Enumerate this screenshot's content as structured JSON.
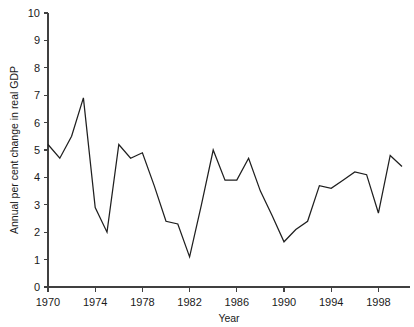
{
  "chart_data": {
    "type": "line",
    "title": "",
    "xlabel": "Year",
    "ylabel": "Annual per cent change in real GDP",
    "xlim": [
      1970,
      2000
    ],
    "ylim": [
      0,
      10
    ],
    "grid": false,
    "legend": null,
    "x_tick_labels": [
      "1970",
      "1974",
      "1978",
      "1982",
      "1986",
      "1990",
      "1994",
      "1998"
    ],
    "x_tick_values": [
      1970,
      1974,
      1978,
      1982,
      1986,
      1990,
      1994,
      1998
    ],
    "y_tick_labels": [
      "0",
      "1",
      "2",
      "3",
      "4",
      "5",
      "6",
      "7",
      "8",
      "9",
      "10"
    ],
    "y_tick_values": [
      0,
      1,
      2,
      3,
      4,
      5,
      6,
      7,
      8,
      9,
      10
    ],
    "line_color": "#1f1f1f",
    "x": [
      1970,
      1971,
      1972,
      1973,
      1974,
      1975,
      1976,
      1977,
      1978,
      1979,
      1980,
      1981,
      1982,
      1983,
      1984,
      1985,
      1986,
      1987,
      1988,
      1989,
      1990,
      1991,
      1992,
      1993,
      1994,
      1995,
      1996,
      1997,
      1998,
      1999,
      2000
    ],
    "values": [
      5.2,
      4.7,
      5.5,
      6.9,
      2.9,
      2.0,
      5.2,
      4.7,
      4.9,
      3.7,
      2.4,
      2.3,
      1.1,
      3.0,
      5.0,
      3.9,
      3.9,
      4.7,
      3.5,
      2.6,
      1.65,
      2.1,
      2.4,
      3.7,
      3.6,
      3.9,
      4.2,
      4.1,
      2.7,
      4.8,
      4.4
    ],
    "series": [
      {
        "name": "Annual per cent change in real GDP",
        "values": [
          5.2,
          4.7,
          5.5,
          6.9,
          2.9,
          2.0,
          5.2,
          4.7,
          4.9,
          3.7,
          2.4,
          2.3,
          1.1,
          3.0,
          5.0,
          3.9,
          3.9,
          4.7,
          3.5,
          2.6,
          1.65,
          2.1,
          2.4,
          3.7,
          3.6,
          3.9,
          4.2,
          4.1,
          2.7,
          4.8,
          4.4
        ]
      }
    ]
  }
}
